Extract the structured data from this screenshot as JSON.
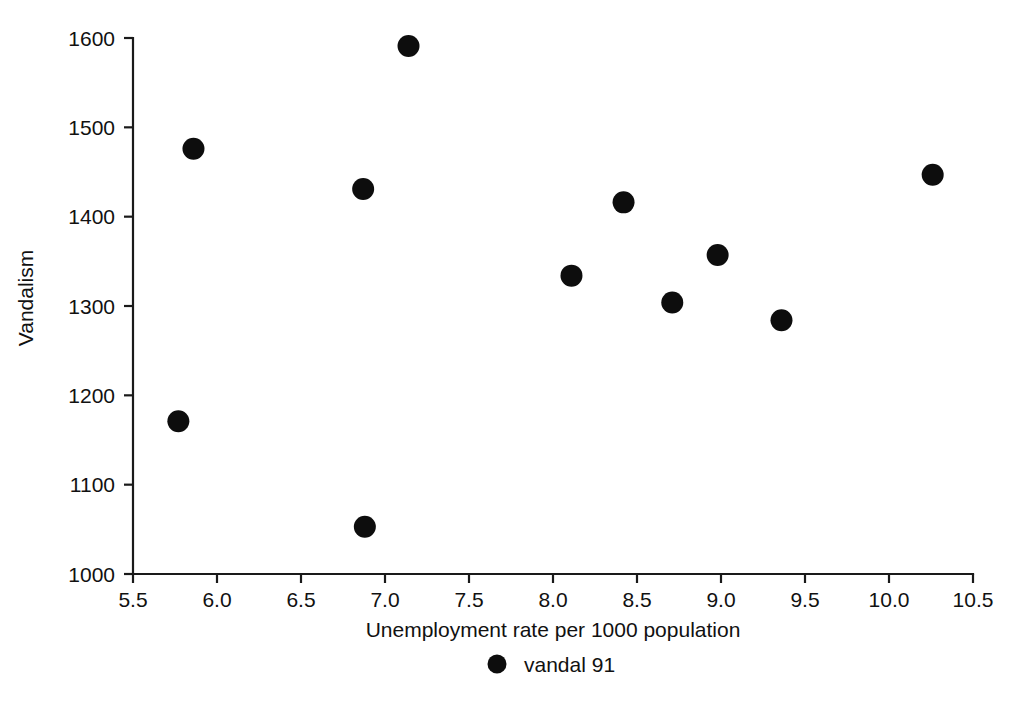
{
  "chart_data": {
    "type": "scatter",
    "title": "",
    "subtitle": "",
    "xlabel": "Unemployment rate per 1000 population",
    "ylabel": "Vandalism",
    "xlim": [
      5.5,
      10.5
    ],
    "ylim": [
      1000,
      1600
    ],
    "grid": false,
    "legend_position": "bottom-center",
    "series": [
      {
        "name": "vandal 91",
        "marker": "filled-circle",
        "color": "#0d0d0d",
        "points": [
          {
            "x": 5.77,
            "y": 1171
          },
          {
            "x": 5.86,
            "y": 1476
          },
          {
            "x": 6.87,
            "y": 1431
          },
          {
            "x": 6.88,
            "y": 1053
          },
          {
            "x": 7.14,
            "y": 1591
          },
          {
            "x": 8.11,
            "y": 1334
          },
          {
            "x": 8.42,
            "y": 1416
          },
          {
            "x": 8.71,
            "y": 1304
          },
          {
            "x": 8.98,
            "y": 1357
          },
          {
            "x": 9.36,
            "y": 1284
          },
          {
            "x": 10.26,
            "y": 1447
          }
        ]
      }
    ],
    "x_ticks": [
      {
        "value": 5.5,
        "label": "5.5"
      },
      {
        "value": 6.0,
        "label": "6.0"
      },
      {
        "value": 6.5,
        "label": "6.5"
      },
      {
        "value": 7.0,
        "label": "7.0"
      },
      {
        "value": 7.5,
        "label": "7.5"
      },
      {
        "value": 8.0,
        "label": "8.0"
      },
      {
        "value": 8.5,
        "label": "8.5"
      },
      {
        "value": 9.0,
        "label": "9.0"
      },
      {
        "value": 9.5,
        "label": "9.5"
      },
      {
        "value": 10.0,
        "label": "10.0"
      },
      {
        "value": 10.5,
        "label": "10.5"
      }
    ],
    "y_ticks": [
      {
        "value": 1000,
        "label": "1000"
      },
      {
        "value": 1100,
        "label": "1100"
      },
      {
        "value": 1200,
        "label": "1200"
      },
      {
        "value": 1300,
        "label": "1300"
      },
      {
        "value": 1400,
        "label": "1400"
      },
      {
        "value": 1500,
        "label": "1500"
      },
      {
        "value": 1600,
        "label": "1600"
      }
    ],
    "legend": [
      {
        "label": "vandal 91",
        "marker": "filled-circle",
        "color": "#0d0d0d"
      }
    ]
  },
  "axes": {
    "x_title": "Unemployment rate per 1000 population",
    "y_title": "Vandalism"
  },
  "legend": {
    "entry_label": "vandal 91"
  },
  "colors": {
    "marker": "#0d0d0d",
    "axis": "#1a1a1a",
    "background": "#ffffff",
    "text": "#111111"
  }
}
